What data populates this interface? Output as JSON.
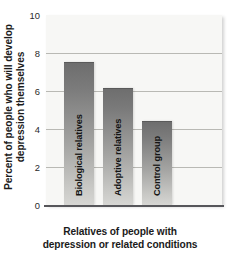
{
  "chart_data": {
    "type": "bar",
    "title": "",
    "subtitle": "",
    "xlabel_line1": "Relatives of people with",
    "xlabel_line2": "depression or related conditions",
    "ylabel_line1": "Percent of people who will develop",
    "ylabel_line2": "depression themselves",
    "categories": [
      "Biological relatives",
      "Adoptive relatives",
      "Control group"
    ],
    "values": [
      7.5,
      6.1,
      4.35
    ],
    "ylim": [
      0,
      10
    ],
    "yticks": [
      10,
      8,
      6,
      4,
      2,
      0
    ],
    "ytick_labels": [
      "10",
      "8",
      "6",
      "4",
      "2",
      "0"
    ],
    "grid": true,
    "grid_axis": "y",
    "legend": "none",
    "bars": [
      {
        "label": "Biological relatives",
        "value": 7.5
      },
      {
        "label": "Adoptive relatives",
        "value": 6.1
      },
      {
        "label": "Control group",
        "value": 4.35
      }
    ]
  },
  "colors": {
    "plot_background": "#f7f7f5",
    "gridline": "#b9b9b4",
    "bar_top": "#6e6e6e",
    "bar_bottom": "#d6d6d3",
    "axis": "#56565a",
    "text": "#1b1b1b",
    "page_background": "#ffffff"
  }
}
